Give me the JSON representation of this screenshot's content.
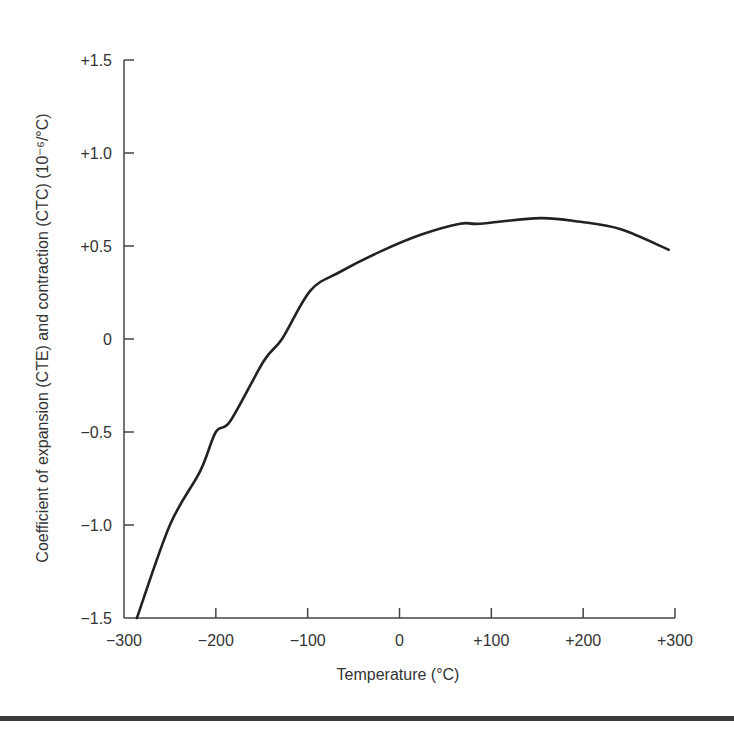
{
  "chart_data": {
    "type": "line",
    "title": "",
    "xlabel": "Temperature (°C)",
    "ylabel": "Coefficient of expansion (CTE) and contraction (CTC) (10⁻⁶/°C)",
    "xlim": [
      -300,
      300
    ],
    "ylim": [
      -1.5,
      1.5
    ],
    "x_ticks": [
      -300,
      -200,
      -100,
      0,
      100,
      200,
      300
    ],
    "x_tick_labels": [
      "−300",
      "−200",
      "−100",
      "0",
      "+100",
      "+200",
      "+300"
    ],
    "y_ticks": [
      1.5,
      1.0,
      0.5,
      0,
      -0.5,
      -1.0,
      -1.5
    ],
    "y_tick_labels": [
      "+1.5",
      "+1.0",
      "+0.5",
      "0",
      "−0.5",
      "−1.0",
      "−1.5"
    ],
    "grid": false,
    "legend": null,
    "series": [
      {
        "name": "CTE/CTC",
        "color": "#222222",
        "x": [
          -286,
          -250,
          -217,
          -200,
          -184,
          -148,
          -128,
          -97,
          -65,
          -21,
          23,
          66,
          88,
          153,
          197,
          241,
          293
        ],
        "y": [
          -1.5,
          -1.0,
          -0.71,
          -0.5,
          -0.44,
          -0.12,
          0.0,
          0.26,
          0.36,
          0.47,
          0.56,
          0.62,
          0.62,
          0.65,
          0.63,
          0.59,
          0.48
        ]
      }
    ]
  },
  "colors": {
    "axis": "#444444",
    "curve": "#222222",
    "text": "#333333",
    "rule": "#3a3a3a"
  }
}
